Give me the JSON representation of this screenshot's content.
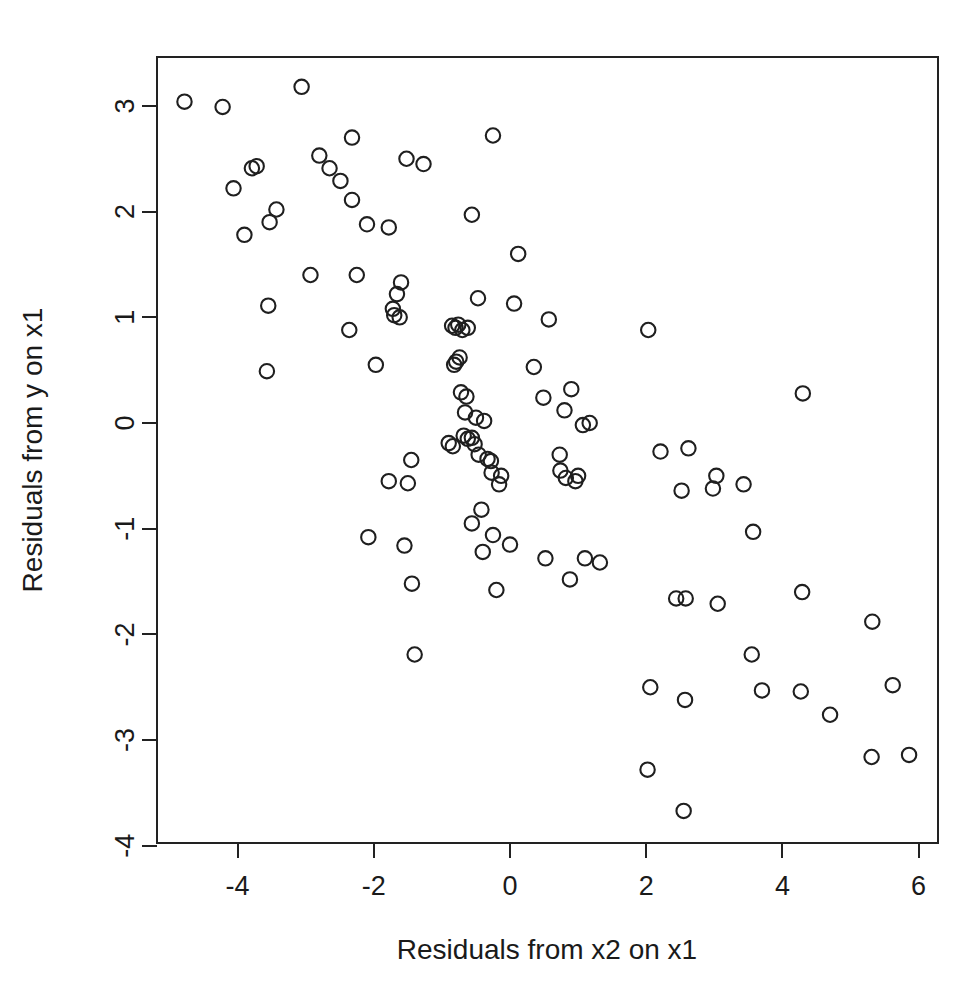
{
  "chart_data": {
    "type": "scatter",
    "title": "",
    "subtitle": "",
    "xlabel": "Residuals from x2 on x1",
    "ylabel": "Residuals from y on x1",
    "xlim": [
      -5.19,
      6.29
    ],
    "ylim": [
      -3.98,
      3.44
    ],
    "xticks": [
      -4,
      -2,
      0,
      2,
      4,
      6
    ],
    "xtick_labels": [
      "-4",
      "-2",
      "0",
      "2",
      "4",
      "6"
    ],
    "yticks": [
      3,
      2,
      1,
      0,
      -1,
      -2,
      -3,
      -4
    ],
    "ytick_labels": [
      "3",
      "2",
      "1",
      "0",
      "-1",
      "-2",
      "-3",
      "-4"
    ],
    "grid": false,
    "legend": null,
    "marker": "open-circle",
    "marker_color": "#1f1f1f",
    "n_points": 119,
    "points": [
      [
        -4.78,
        3.04
      ],
      [
        -4.22,
        2.99
      ],
      [
        -3.06,
        3.18
      ],
      [
        -2.32,
        2.7
      ],
      [
        -0.25,
        2.72
      ],
      [
        -1.52,
        2.5
      ],
      [
        -1.27,
        2.45
      ],
      [
        -2.8,
        2.53
      ],
      [
        -2.65,
        2.41
      ],
      [
        -3.79,
        2.41
      ],
      [
        -3.72,
        2.43
      ],
      [
        -4.06,
        2.22
      ],
      [
        -2.49,
        2.29
      ],
      [
        -2.32,
        2.11
      ],
      [
        -3.43,
        2.02
      ],
      [
        -3.9,
        1.78
      ],
      [
        -0.56,
        1.97
      ],
      [
        -2.1,
        1.88
      ],
      [
        -1.78,
        1.85
      ],
      [
        -3.53,
        1.9
      ],
      [
        0.12,
        1.6
      ],
      [
        -2.25,
        1.4
      ],
      [
        -2.93,
        1.4
      ],
      [
        -1.6,
        1.33
      ],
      [
        -1.66,
        1.22
      ],
      [
        -3.55,
        1.11
      ],
      [
        -1.72,
        1.08
      ],
      [
        -1.7,
        1.02
      ],
      [
        -1.62,
        1.0
      ],
      [
        -0.47,
        1.18
      ],
      [
        0.06,
        1.13
      ],
      [
        0.57,
        0.98
      ],
      [
        -2.36,
        0.88
      ],
      [
        -0.85,
        0.92
      ],
      [
        -0.8,
        0.9
      ],
      [
        -0.76,
        0.93
      ],
      [
        -0.7,
        0.88
      ],
      [
        -0.62,
        0.9
      ],
      [
        2.03,
        0.88
      ],
      [
        -1.97,
        0.55
      ],
      [
        -0.79,
        0.58
      ],
      [
        -0.74,
        0.62
      ],
      [
        -0.82,
        0.55
      ],
      [
        0.35,
        0.53
      ],
      [
        -3.57,
        0.49
      ],
      [
        -0.72,
        0.29
      ],
      [
        -0.64,
        0.25
      ],
      [
        0.49,
        0.24
      ],
      [
        0.9,
        0.32
      ],
      [
        4.3,
        0.28
      ],
      [
        -0.66,
        0.1
      ],
      [
        -0.5,
        0.05
      ],
      [
        -0.38,
        0.02
      ],
      [
        0.8,
        0.12
      ],
      [
        1.17,
        0.0
      ],
      [
        -0.68,
        -0.12
      ],
      [
        -0.62,
        -0.15
      ],
      [
        -0.56,
        -0.14
      ],
      [
        -0.52,
        -0.2
      ],
      [
        -0.9,
        -0.19
      ],
      [
        -0.84,
        -0.22
      ],
      [
        1.07,
        -0.02
      ],
      [
        -0.46,
        -0.3
      ],
      [
        -0.33,
        -0.34
      ],
      [
        -0.28,
        -0.36
      ],
      [
        -1.45,
        -0.35
      ],
      [
        0.73,
        -0.3
      ],
      [
        2.21,
        -0.27
      ],
      [
        2.62,
        -0.24
      ],
      [
        -0.27,
        -0.47
      ],
      [
        -0.13,
        -0.5
      ],
      [
        0.74,
        -0.45
      ],
      [
        0.82,
        -0.52
      ],
      [
        0.96,
        -0.55
      ],
      [
        1.0,
        -0.5
      ],
      [
        3.03,
        -0.5
      ],
      [
        3.43,
        -0.58
      ],
      [
        -1.78,
        -0.55
      ],
      [
        -1.5,
        -0.57
      ],
      [
        -0.16,
        -0.58
      ],
      [
        2.52,
        -0.64
      ],
      [
        2.98,
        -0.62
      ],
      [
        -0.42,
        -0.82
      ],
      [
        -0.56,
        -0.95
      ],
      [
        -0.25,
        -1.06
      ],
      [
        -2.08,
        -1.08
      ],
      [
        -1.55,
        -1.16
      ],
      [
        -0.4,
        -1.22
      ],
      [
        0.0,
        -1.15
      ],
      [
        0.52,
        -1.28
      ],
      [
        3.57,
        -1.03
      ],
      [
        1.1,
        -1.28
      ],
      [
        1.32,
        -1.32
      ],
      [
        0.88,
        -1.48
      ],
      [
        -0.2,
        -1.58
      ],
      [
        -1.44,
        -1.52
      ],
      [
        2.44,
        -1.66
      ],
      [
        2.58,
        -1.66
      ],
      [
        4.29,
        -1.6
      ],
      [
        3.05,
        -1.71
      ],
      [
        -1.4,
        -2.19
      ],
      [
        5.32,
        -1.88
      ],
      [
        3.55,
        -2.19
      ],
      [
        3.7,
        -2.53
      ],
      [
        2.06,
        -2.5
      ],
      [
        2.57,
        -2.62
      ],
      [
        4.27,
        -2.54
      ],
      [
        5.62,
        -2.48
      ],
      [
        4.7,
        -2.76
      ],
      [
        5.31,
        -3.16
      ],
      [
        5.86,
        -3.14
      ],
      [
        2.02,
        -3.28
      ],
      [
        2.55,
        -3.67
      ]
    ]
  }
}
